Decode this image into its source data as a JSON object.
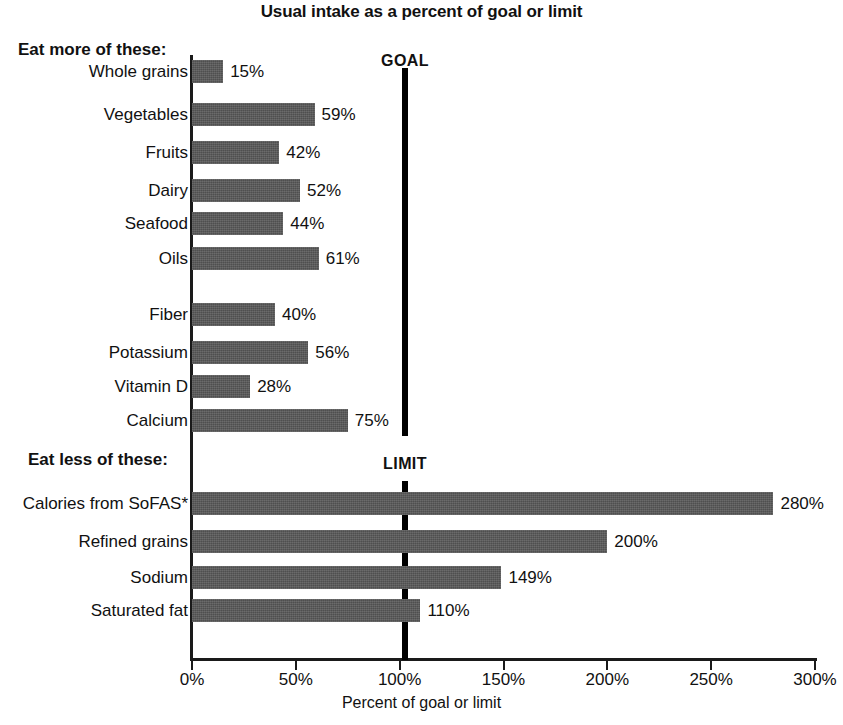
{
  "chart_data": {
    "type": "bar",
    "orientation": "horizontal",
    "title": "Usual intake as a percent of goal or limit",
    "xlabel": "Percent of goal or limit",
    "ylabel": "",
    "xlim": [
      0,
      300
    ],
    "grid": false,
    "legend": "none",
    "tick_labels": [
      "0%",
      "50%",
      "100%",
      "150%",
      "200%",
      "250%",
      "300%"
    ],
    "tick_values": [
      0,
      50,
      100,
      150,
      200,
      250,
      300
    ],
    "reference_lines": [
      {
        "label": "GOAL",
        "value": 100
      },
      {
        "label": "LIMIT",
        "value": 100
      }
    ],
    "groups": [
      {
        "heading": "Eat more of these:",
        "categories": [
          "Whole grains",
          "Vegetables",
          "Fruits",
          "Dairy",
          "Seafood",
          "Oils",
          "Fiber",
          "Potassium",
          "Vitamin D",
          "Calcium"
        ],
        "values": [
          15,
          59,
          42,
          52,
          44,
          61,
          40,
          56,
          28,
          75
        ],
        "value_labels": [
          "15%",
          "59%",
          "42%",
          "52%",
          "44%",
          "61%",
          "40%",
          "56%",
          "28%",
          "75%"
        ]
      },
      {
        "heading": "Eat less of these:",
        "categories": [
          "Calories from SoFAS*",
          "Refined grains",
          "Sodium",
          "Saturated fat"
        ],
        "values": [
          280,
          200,
          149,
          110
        ],
        "value_labels": [
          "280%",
          "200%",
          "149%",
          "110%"
        ]
      }
    ],
    "bar_color": "#565656",
    "axis_color": "#1a1a1a",
    "background_color": "#ffffff"
  },
  "bars": [
    {
      "label": "Whole grains",
      "value_label": "15%",
      "value": 15,
      "top": 60
    },
    {
      "label": "Vegetables",
      "value_label": "59%",
      "value": 59,
      "top": 103
    },
    {
      "label": "Fruits",
      "value_label": "42%",
      "value": 42,
      "top": 141
    },
    {
      "label": "Dairy",
      "value_label": "52%",
      "value": 52,
      "top": 179
    },
    {
      "label": "Seafood",
      "value_label": "44%",
      "value": 44,
      "top": 212
    },
    {
      "label": "Oils",
      "value_label": "61%",
      "value": 61,
      "top": 247
    },
    {
      "label": "Fiber",
      "value_label": "40%",
      "value": 40,
      "top": 303
    },
    {
      "label": "Potassium",
      "value_label": "56%",
      "value": 56,
      "top": 341
    },
    {
      "label": "Vitamin D",
      "value_label": "28%",
      "value": 28,
      "top": 375
    },
    {
      "label": "Calcium",
      "value_label": "75%",
      "value": 75,
      "top": 409
    },
    {
      "label": "Calories from SoFAS*",
      "value_label": "280%",
      "value": 280,
      "top": 492
    },
    {
      "label": "Refined grains",
      "value_label": "200%",
      "value": 200,
      "top": 530
    },
    {
      "label": "Sodium",
      "value_label": "149%",
      "value": 149,
      "top": 566
    },
    {
      "label": "Saturated fat",
      "value_label": "110%",
      "value": 110,
      "top": 599
    }
  ],
  "headings": {
    "eat_more": "Eat more of these:",
    "eat_less": "Eat less of these:"
  },
  "ref": {
    "goal": "GOAL",
    "limit": "LIMIT"
  },
  "axis": {
    "title": "Percent of goal or limit",
    "ticks": [
      "0%",
      "50%",
      "100%",
      "150%",
      "200%",
      "250%",
      "300%"
    ]
  },
  "title": "Usual intake as a percent of goal or limit"
}
